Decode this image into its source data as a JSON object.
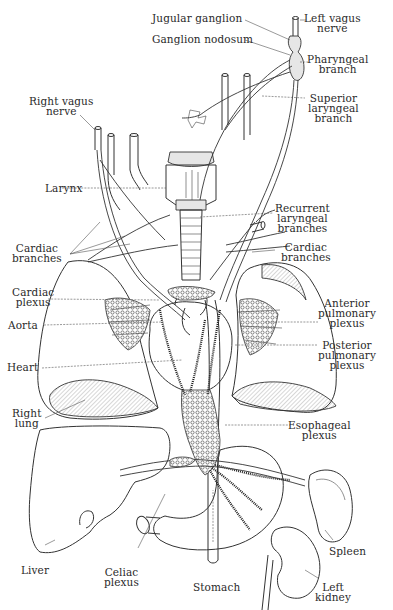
{
  "figure": {
    "labels": {
      "jugular_ganglion": "Jugular ganglion",
      "ganglion_nodosum": "Ganglion nodosum",
      "left_vagus_nerve": "Left vagus\nnerve",
      "pharyngeal_branch": "Pharyngeal\nbranch",
      "right_vagus_nerve": "Right vagus\nnerve",
      "superior_laryngeal_branch": "Superior\nlaryngeal\nbranch",
      "larynx": "Larynx",
      "recurrent_laryngeal_branches": "Recurrent\nlaryngeal\nbranches",
      "cardiac_branches_left": "Cardiac\nbranches",
      "cardiac_branches_right": "Cardiac\nbranches",
      "cardiac_plexus": "Cardiac\nplexus",
      "anterior_pulmonary_plexus": "Anterior\npulmonary\nplexus",
      "aorta": "Aorta",
      "posterior_pulmonary_plexus": "Posterior\npulmonary\nplexus",
      "heart": "Heart",
      "right_lung": "Right\nlung",
      "esophageal_plexus": "Esophageal\nplexus",
      "liver": "Liver",
      "celiac_plexus": "Celiac\nplexus",
      "stomach": "Stomach",
      "spleen": "Spleen",
      "left_kidney": "Left\nkidney"
    }
  }
}
